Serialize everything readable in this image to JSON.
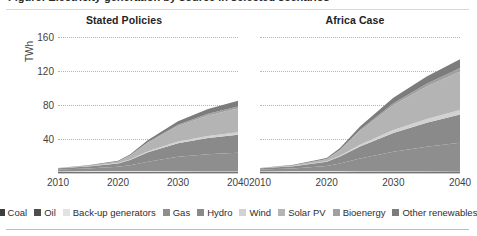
{
  "figure": {
    "clipped_title": "Figure: Electricity generation by source in selected scenarios",
    "y_axis_label": "TWh",
    "y_ticks": [
      "160",
      "120",
      "80",
      "40"
    ],
    "x_ticks": [
      "2010",
      "2020",
      "2030",
      "2040"
    ]
  },
  "panels": [
    {
      "id": "stated-policies",
      "title": "Stated Policies"
    },
    {
      "id": "africa-case",
      "title": "Africa Case"
    }
  ],
  "legend": {
    "items": [
      {
        "label": "Coal",
        "color": "#3d3d3d"
      },
      {
        "label": "Oil",
        "color": "#4d4d4d"
      },
      {
        "label": "Back-up generators",
        "color": "#e2e2e2"
      },
      {
        "label": "Gas",
        "color": "#8e8e8e"
      },
      {
        "label": "Hydro",
        "color": "#8a8a8a"
      },
      {
        "label": "Wind",
        "color": "#d2d2d2"
      },
      {
        "label": "Solar PV",
        "color": "#b4b4b4"
      },
      {
        "label": "Bioenergy",
        "color": "#a0a0a0"
      },
      {
        "label": "Other renewables",
        "color": "#7c7c7c"
      }
    ]
  },
  "chart_data": {
    "type": "area",
    "title": "Electricity generation by source in selected scenarios",
    "xlabel": "",
    "ylabel": "TWh",
    "ylim": [
      0,
      170
    ],
    "xlim": [
      2010,
      2040
    ],
    "grid": true,
    "gridlines": [
      40,
      80,
      120,
      160
    ],
    "legend_position": "bottom",
    "stacking": "normal",
    "panels": [
      {
        "name": "Stated Policies",
        "x": [
          2010,
          2015,
          2020,
          2022,
          2025,
          2030,
          2035,
          2040
        ],
        "series": [
          {
            "name": "Coal",
            "color": "#3d3d3d",
            "values": [
              0.4,
              0.5,
              0.5,
              0.5,
              0.6,
              0.6,
              0.7,
              0.7
            ]
          },
          {
            "name": "Oil",
            "color": "#4d4d4d",
            "values": [
              1.0,
              1.0,
              0.9,
              0.9,
              0.8,
              0.7,
              0.6,
              0.5
            ]
          },
          {
            "name": "Back-up generators",
            "color": "#e2e2e2",
            "values": [
              0.6,
              0.7,
              0.8,
              0.8,
              0.8,
              0.7,
              0.6,
              0.5
            ]
          },
          {
            "name": "Gas",
            "color": "#8e8e8e",
            "values": [
              2.0,
              3.0,
              5.0,
              7.0,
              11.0,
              17.0,
              20.0,
              22.0
            ]
          },
          {
            "name": "Hydro",
            "color": "#8a8a8a",
            "values": [
              1.5,
              2.5,
              4.0,
              6.0,
              11.0,
              16.0,
              19.0,
              21.0
            ]
          },
          {
            "name": "Wind",
            "color": "#d2d2d2",
            "values": [
              0.1,
              0.2,
              0.4,
              0.7,
              1.2,
              2.0,
              2.6,
              3.0
            ]
          },
          {
            "name": "Solar PV",
            "color": "#b4b4b4",
            "values": [
              0.1,
              0.5,
              1.5,
              4.0,
              10.0,
              18.0,
              24.0,
              28.0
            ]
          },
          {
            "name": "Bioenergy",
            "color": "#a0a0a0",
            "values": [
              0.1,
              0.2,
              0.4,
              0.6,
              1.0,
              1.6,
              2.0,
              2.3
            ]
          },
          {
            "name": "Other renewables",
            "color": "#7c7c7c",
            "values": [
              0.2,
              0.4,
              0.8,
              1.3,
              2.3,
              4.0,
              5.5,
              6.7
            ]
          }
        ],
        "total_2040": 85
      },
      {
        "name": "Africa Case",
        "x": [
          2010,
          2015,
          2020,
          2022,
          2025,
          2030,
          2035,
          2040
        ],
        "series": [
          {
            "name": "Coal",
            "color": "#3d3d3d",
            "values": [
              0.4,
              0.5,
              0.5,
              0.5,
              0.6,
              0.6,
              0.7,
              0.7
            ]
          },
          {
            "name": "Oil",
            "color": "#4d4d4d",
            "values": [
              1.0,
              1.0,
              0.9,
              0.9,
              0.8,
              0.7,
              0.6,
              0.5
            ]
          },
          {
            "name": "Back-up generators",
            "color": "#e2e2e2",
            "values": [
              0.6,
              0.7,
              0.8,
              0.8,
              0.7,
              0.6,
              0.5,
              0.4
            ]
          },
          {
            "name": "Gas",
            "color": "#8e8e8e",
            "values": [
              2.0,
              3.2,
              6.0,
              9.0,
              15.0,
              23.0,
              29.0,
              34.0
            ]
          },
          {
            "name": "Hydro",
            "color": "#8a8a8a",
            "values": [
              1.5,
              2.6,
              5.0,
              8.0,
              14.0,
              22.0,
              28.0,
              33.0
            ]
          },
          {
            "name": "Wind",
            "color": "#d2d2d2",
            "values": [
              0.1,
              0.3,
              0.6,
              1.1,
              2.0,
              3.4,
              4.5,
              5.4
            ]
          },
          {
            "name": "Solar PV",
            "color": "#b4b4b4",
            "values": [
              0.1,
              0.6,
              2.2,
              6.0,
              16.0,
              29.0,
              38.0,
              45.0
            ]
          },
          {
            "name": "Bioenergy",
            "color": "#a0a0a0",
            "values": [
              0.1,
              0.2,
              0.5,
              0.9,
              1.6,
              2.6,
              3.4,
              4.0
            ]
          },
          {
            "name": "Other renewables",
            "color": "#7c7c7c",
            "values": [
              0.2,
              0.5,
              1.1,
              2.0,
              3.8,
              6.4,
              8.5,
              10.3
            ]
          }
        ],
        "total_2040": 133
      }
    ]
  }
}
